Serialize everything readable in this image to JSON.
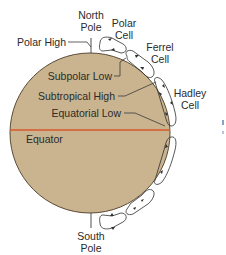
{
  "diagram": {
    "type": "atmospheric-circulation-cells",
    "colors": {
      "earth_fill": "#c9b48f",
      "earth_stroke": "#5a4a35",
      "equator_line": "#d9572b",
      "cell_stroke": "#2f2f2f",
      "text": "#2b2b2b",
      "leader_line": "#3a3a3a"
    },
    "poles": {
      "north": {
        "line1": "North",
        "line2": "Pole"
      },
      "south": {
        "line1": "South",
        "line2": "Pole"
      }
    },
    "pressure_labels": {
      "polar_high": "Polar High",
      "subpolar_low": "Subpolar Low",
      "subtropical_high": "Subtropical High",
      "equatorial_low": "Equatorial Low",
      "equator": "Equator"
    },
    "cells": {
      "polar": {
        "line1": "Polar",
        "line2": "Cell"
      },
      "ferrel": {
        "line1": "Ferrel",
        "line2": "Cell"
      },
      "hadley": {
        "line1": "Hadley",
        "line2": "Cell"
      }
    }
  }
}
